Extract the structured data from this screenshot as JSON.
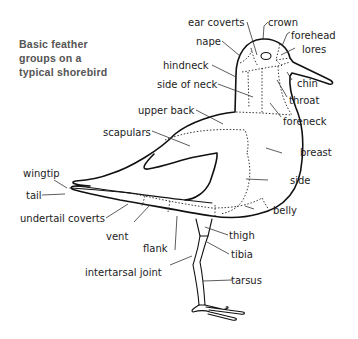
{
  "title": {
    "lines": [
      "Basic feather",
      "groups on a",
      "typical shorebird"
    ]
  },
  "labels": {
    "ear_coverts": "ear coverts",
    "crown": "crown",
    "forehead": "forehead",
    "lores": "lores",
    "nape": "nape",
    "hindneck": "hindneck",
    "chin": "chin",
    "side_of_neck": "side of neck",
    "throat": "throat",
    "upper_back": "upper back",
    "foreneck": "foreneck",
    "scapulars": "scapulars",
    "breast": "breast",
    "wingtip": "wingtip",
    "side": "side",
    "tail": "tail",
    "belly": "belly",
    "undertail_coverts": "undertail coverts",
    "thigh": "thigh",
    "vent": "vent",
    "tibia": "tibia",
    "flank": "flank",
    "intertarsal_joint": "intertarsal joint",
    "tarsus": "tarsus"
  },
  "colors": {
    "title": "#555555",
    "line": "#111111",
    "text": "#222222",
    "background": "#ffffff"
  }
}
